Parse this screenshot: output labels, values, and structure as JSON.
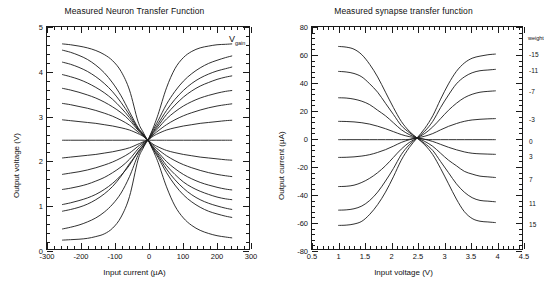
{
  "figure": {
    "background": "#ffffff",
    "ink": "#1a1a1a"
  },
  "chart_data": [
    {
      "id": "neuron",
      "type": "line",
      "title": "Measured Neuron Transfer Function",
      "xlabel": "Input current (µA)",
      "ylabel": "Output voltage (V)",
      "xlim": [
        -300,
        300
      ],
      "ylim": [
        0,
        5
      ],
      "xticks": [
        -300,
        -200,
        -100,
        0,
        100,
        200,
        300
      ],
      "xticklabels": [
        "-300",
        "-200",
        "-100",
        "0",
        "100",
        "200",
        "300"
      ],
      "yticks": [
        0,
        1,
        2,
        3,
        4,
        5
      ],
      "yticklabels": [
        "0",
        "1",
        "2",
        "3",
        "4",
        "5"
      ],
      "x_minor_step": 20,
      "y_minor_step": 0.2,
      "grid": false,
      "legend": "none",
      "annotations": [
        {
          "name": "vgain",
          "text": "V",
          "sub": "gain",
          "x": 235,
          "y": 4.72
        }
      ],
      "note": "13 sigmoid curves of increasing gain, all crossing at (0, 2.45); data sampled from -255 to 250 uA",
      "x": [
        -255,
        -230,
        -205,
        -180,
        -155,
        -130,
        -105,
        -80,
        -55,
        -30,
        -15,
        -5,
        0,
        5,
        15,
        30,
        55,
        80,
        105,
        130,
        155,
        180,
        205,
        230,
        250
      ],
      "series": [
        {
          "name": "gain-1-lowest",
          "values": [
            2.45,
            2.45,
            2.45,
            2.45,
            2.45,
            2.45,
            2.45,
            2.45,
            2.45,
            2.45,
            2.45,
            2.45,
            2.45,
            2.45,
            2.45,
            2.45,
            2.45,
            2.45,
            2.45,
            2.45,
            2.45,
            2.45,
            2.45,
            2.45,
            2.45
          ]
        },
        {
          "name": "gain-2",
          "values": [
            2.91,
            2.89,
            2.87,
            2.85,
            2.83,
            2.8,
            2.77,
            2.73,
            2.68,
            2.6,
            2.54,
            2.48,
            2.45,
            2.42,
            2.36,
            2.3,
            2.22,
            2.17,
            2.13,
            2.1,
            2.07,
            2.05,
            2.03,
            2.01,
            2.0
          ]
        },
        {
          "name": "gain-2b",
          "values": [
            2.05,
            2.07,
            2.09,
            2.11,
            2.13,
            2.16,
            2.19,
            2.23,
            2.28,
            2.36,
            2.41,
            2.44,
            2.45,
            2.48,
            2.54,
            2.6,
            2.68,
            2.73,
            2.77,
            2.8,
            2.83,
            2.85,
            2.87,
            2.89,
            2.9
          ]
        },
        {
          "name": "gain-3",
          "values": [
            3.28,
            3.25,
            3.21,
            3.17,
            3.12,
            3.06,
            2.99,
            2.9,
            2.79,
            2.64,
            2.55,
            2.48,
            2.45,
            2.41,
            2.33,
            2.24,
            2.1,
            1.99,
            1.9,
            1.83,
            1.77,
            1.72,
            1.68,
            1.65,
            1.63
          ]
        },
        {
          "name": "gain-3b",
          "values": [
            1.68,
            1.71,
            1.74,
            1.78,
            1.83,
            1.89,
            1.96,
            2.05,
            2.16,
            2.31,
            2.39,
            2.44,
            2.45,
            2.49,
            2.57,
            2.66,
            2.8,
            2.91,
            3.0,
            3.07,
            3.13,
            3.18,
            3.22,
            3.25,
            3.27
          ]
        },
        {
          "name": "gain-4",
          "values": [
            3.62,
            3.58,
            3.53,
            3.47,
            3.4,
            3.31,
            3.2,
            3.07,
            2.9,
            2.68,
            2.57,
            2.48,
            2.45,
            2.4,
            2.3,
            2.18,
            1.97,
            1.81,
            1.68,
            1.58,
            1.5,
            1.44,
            1.39,
            1.35,
            1.33
          ]
        },
        {
          "name": "gain-4b",
          "values": [
            1.34,
            1.37,
            1.41,
            1.46,
            1.53,
            1.61,
            1.72,
            1.85,
            2.02,
            2.25,
            2.36,
            2.43,
            2.45,
            2.5,
            2.6,
            2.72,
            2.93,
            3.09,
            3.22,
            3.32,
            3.4,
            3.46,
            3.51,
            3.55,
            3.57
          ]
        },
        {
          "name": "gain-5",
          "values": [
            3.93,
            3.88,
            3.82,
            3.74,
            3.64,
            3.52,
            3.37,
            3.18,
            2.96,
            2.7,
            2.58,
            2.49,
            2.45,
            2.4,
            2.28,
            2.14,
            1.88,
            1.68,
            1.51,
            1.39,
            1.3,
            1.23,
            1.17,
            1.13,
            1.11
          ]
        },
        {
          "name": "gain-5b",
          "values": [
            1.0,
            1.04,
            1.09,
            1.15,
            1.23,
            1.34,
            1.48,
            1.66,
            1.89,
            2.19,
            2.33,
            2.42,
            2.45,
            2.51,
            2.62,
            2.77,
            3.03,
            3.24,
            3.42,
            3.56,
            3.67,
            3.75,
            3.82,
            3.87,
            3.9
          ]
        },
        {
          "name": "gain-6",
          "values": [
            4.21,
            4.16,
            4.09,
            4.0,
            3.88,
            3.73,
            3.54,
            3.3,
            3.02,
            2.72,
            2.59,
            2.49,
            2.45,
            2.39,
            2.26,
            2.1,
            1.8,
            1.56,
            1.37,
            1.22,
            1.11,
            1.03,
            0.97,
            0.92,
            0.89
          ]
        },
        {
          "name": "gain-6b",
          "values": [
            0.85,
            0.89,
            0.94,
            1.01,
            1.11,
            1.24,
            1.41,
            1.64,
            1.92,
            2.17,
            2.32,
            2.42,
            2.45,
            2.52,
            2.64,
            2.82,
            3.12,
            3.37,
            3.57,
            3.73,
            3.85,
            3.94,
            4.01,
            4.06,
            4.1
          ]
        },
        {
          "name": "gain-7",
          "values": [
            4.48,
            4.43,
            4.36,
            4.27,
            4.14,
            3.97,
            3.74,
            3.45,
            3.09,
            2.74,
            2.6,
            2.49,
            2.45,
            2.39,
            2.25,
            2.06,
            1.72,
            1.44,
            1.22,
            1.06,
            0.94,
            0.85,
            0.79,
            0.74,
            0.71
          ]
        },
        {
          "name": "gain-7b",
          "values": [
            0.45,
            0.49,
            0.54,
            0.61,
            0.7,
            0.83,
            1.01,
            1.26,
            1.63,
            2.11,
            2.29,
            2.41,
            2.45,
            2.53,
            2.68,
            2.89,
            3.26,
            3.55,
            3.78,
            3.95,
            4.08,
            4.18,
            4.25,
            4.31,
            4.35
          ]
        },
        {
          "name": "gain-8",
          "values": [
            4.62,
            4.6,
            4.57,
            4.53,
            4.47,
            4.38,
            4.24,
            4.0,
            3.58,
            2.88,
            2.64,
            2.5,
            2.45,
            2.38,
            2.22,
            1.95,
            1.4,
            0.97,
            0.7,
            0.53,
            0.42,
            0.35,
            0.3,
            0.27,
            0.25
          ]
        },
        {
          "name": "gain-8b",
          "values": [
            0.2,
            0.21,
            0.22,
            0.24,
            0.28,
            0.34,
            0.47,
            0.72,
            1.18,
            2.0,
            2.26,
            2.4,
            2.45,
            2.54,
            2.72,
            3.03,
            3.63,
            4.06,
            4.31,
            4.45,
            4.53,
            4.57,
            4.6,
            4.61,
            4.62
          ]
        }
      ]
    },
    {
      "id": "synapse",
      "type": "line",
      "title": "Measured synapse transfer function",
      "xlabel": "Input voltage (V)",
      "ylabel": "Output current (µA)",
      "xlim": [
        0.5,
        4.5
      ],
      "ylim": [
        -80,
        80
      ],
      "xticks": [
        0.5,
        1,
        1.5,
        2,
        2.5,
        3,
        3.5,
        4,
        4.5
      ],
      "xticklabels": [
        "0.5",
        "1",
        "1.5",
        "2",
        "2.5",
        "3",
        "3.5",
        "4",
        "4.5"
      ],
      "yticks": [
        -80,
        -60,
        -40,
        -20,
        0,
        20,
        40,
        60,
        80
      ],
      "yticklabels": [
        "-80",
        "-60",
        "-40",
        "-20",
        "0",
        "20",
        "40",
        "60",
        "80"
      ],
      "x_minor_step": 0.1,
      "y_minor_step": 4,
      "grid": false,
      "legend": "right-inline",
      "legend_title": "weight",
      "note": "9 sigmoid curves indexed by synapse weight, all crossing at (2.5, 0); data sampled from 1.0 to 4.0 V",
      "x": [
        1.0,
        1.15,
        1.3,
        1.45,
        1.6,
        1.75,
        1.9,
        2.05,
        2.2,
        2.35,
        2.5,
        2.65,
        2.8,
        2.95,
        3.1,
        3.25,
        3.4,
        3.55,
        3.7,
        3.85,
        4.0
      ],
      "series": [
        {
          "name": "weight-15",
          "label": "15",
          "values": [
            66,
            65.5,
            64,
            60,
            53,
            44,
            33,
            22,
            12,
            5,
            0,
            -5,
            -12,
            -22,
            -33,
            -44,
            -53,
            -58,
            -60,
            -60.5,
            -61
          ]
        },
        {
          "name": "weight-11",
          "label": "11",
          "values": [
            48,
            47.6,
            46.5,
            44,
            39,
            33,
            25,
            17,
            9,
            4,
            0,
            -4,
            -9,
            -17,
            -25,
            -33,
            -39,
            -43,
            -45,
            -45.5,
            -46
          ]
        },
        {
          "name": "weight-7",
          "label": "7",
          "values": [
            29,
            28.8,
            28,
            26.5,
            24,
            20,
            16,
            11,
            6,
            2.5,
            0,
            -2.5,
            -6,
            -11,
            -16,
            -20,
            -24,
            -26,
            -27.5,
            -28,
            -28.5
          ]
        },
        {
          "name": "weight-3",
          "label": "3",
          "values": [
            12,
            11.9,
            11.6,
            11,
            10,
            8.5,
            6.7,
            4.6,
            2.5,
            1.0,
            0,
            -1.0,
            -2.5,
            -4.6,
            -6.7,
            -8.5,
            -10,
            -11,
            -11.4,
            -11.6,
            -11.8
          ]
        },
        {
          "name": "weight-0",
          "label": "0",
          "values": [
            -1.2,
            -1.2,
            -1.2,
            -1.2,
            -1.2,
            -1.2,
            -1.2,
            -1.2,
            -1.2,
            -1.0,
            0,
            -1.0,
            -1.2,
            -1.2,
            -1.2,
            -1.2,
            -1.2,
            -1.2,
            -1.2,
            -1.2,
            -1.2
          ]
        },
        {
          "name": "weight-minus3",
          "label": "-3",
          "values": [
            -14,
            -13.9,
            -13.6,
            -13,
            -12,
            -10.4,
            -8.4,
            -5.9,
            -3.2,
            -1.3,
            0,
            1.3,
            3.2,
            5.9,
            8.4,
            10.4,
            12,
            13,
            13.5,
            13.8,
            14
          ]
        },
        {
          "name": "weight-minus7",
          "label": "-7",
          "values": [
            -35,
            -34.8,
            -34,
            -32,
            -29,
            -25,
            -20,
            -14,
            -8,
            -3.3,
            0,
            3.3,
            8,
            14,
            20,
            25,
            29,
            31.5,
            33,
            33.6,
            34
          ]
        },
        {
          "name": "weight-minus11",
          "label": "-11",
          "values": [
            -52,
            -51.8,
            -51,
            -49,
            -45,
            -39,
            -31,
            -22,
            -12,
            -5,
            0,
            5,
            12,
            22,
            31,
            39,
            44,
            47,
            48.5,
            49,
            49.5
          ]
        },
        {
          "name": "weight-minus15",
          "label": "-15",
          "values": [
            -63,
            -62.8,
            -62,
            -60,
            -55,
            -48,
            -39,
            -28,
            -16,
            -7,
            0,
            7,
            16,
            28,
            39,
            48,
            54,
            57.5,
            59,
            60,
            60.5
          ]
        }
      ]
    }
  ]
}
